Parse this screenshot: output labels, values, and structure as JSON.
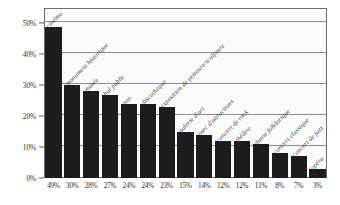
{
  "chart_data": {
    "type": "bar",
    "title": "",
    "xlabel": "",
    "ylabel": "",
    "ylim": [
      0,
      55
    ],
    "grid": true,
    "legend": "none",
    "y_ticks": [
      "0%",
      "10%",
      "20%",
      "30%",
      "40%",
      "50%"
    ],
    "y_tick_values": [
      0,
      10,
      20,
      30,
      40,
      50
    ],
    "categories": [
      "cinéma",
      "monument historique",
      "musée",
      "bal public",
      "zoo",
      "discothèque",
      "exposition de peinture/sculpture",
      "galerie d'art",
      "parc d'attractions",
      "concert de rock",
      "théâtre",
      "danse folklorique",
      "concert classique",
      "concert de jazz",
      "opéra"
    ],
    "values": [
      49,
      30,
      28,
      27,
      24,
      24,
      23,
      15,
      14,
      12,
      12,
      11,
      8,
      7,
      3
    ],
    "value_labels": [
      "49%",
      "30%",
      "28%",
      "27%",
      "24%",
      "24%",
      "23%",
      "15%",
      "14%",
      "12%",
      "12%",
      "11%",
      "8%",
      "7%",
      "3%"
    ],
    "colors": {
      "bar": "#1c1c1c",
      "grid": "#8d8d8d",
      "frame": "#6e6e6e",
      "plot_background": "#fafafa",
      "text": "#2c2c2c"
    }
  }
}
